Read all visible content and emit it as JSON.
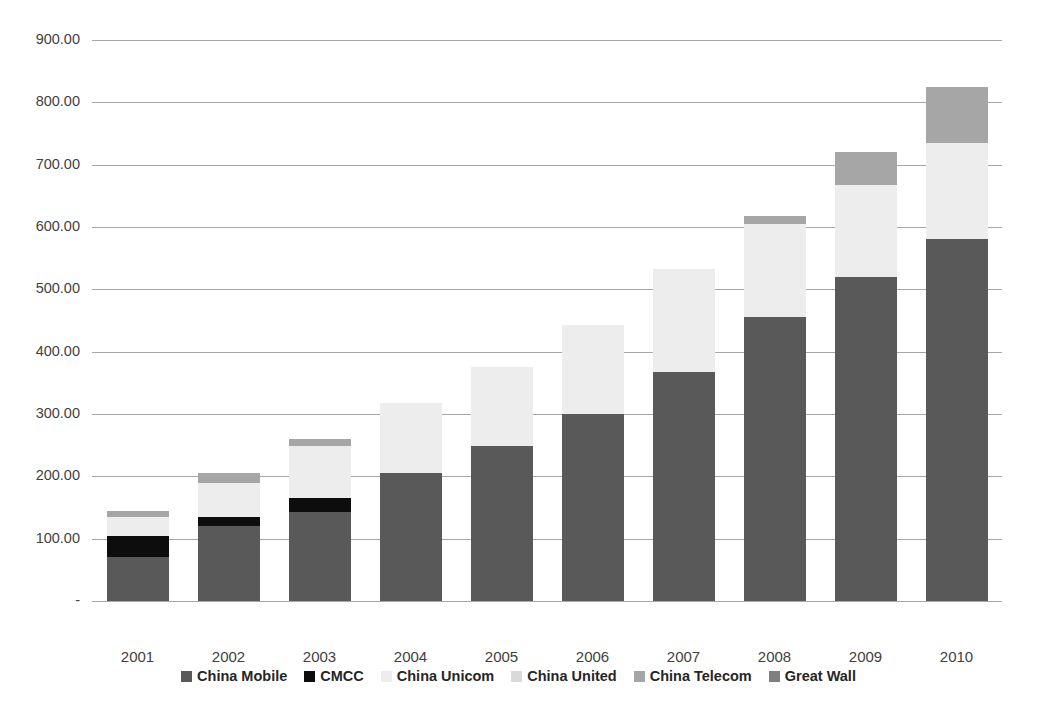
{
  "chart_data": {
    "type": "bar",
    "stacked": true,
    "title": "",
    "xlabel": "",
    "ylabel": "",
    "ylim": [
      0,
      900
    ],
    "grid": true,
    "legend_position": "bottom",
    "categories": [
      "2001",
      "2002",
      "2003",
      "2004",
      "2005",
      "2006",
      "2007",
      "2008",
      "2009",
      "2010"
    ],
    "ytick_labels": [
      "900.00",
      "800.00",
      "700.00",
      "600.00",
      "500.00",
      "400.00",
      "300.00",
      "200.00",
      "100.00",
      "-"
    ],
    "ytick_values": [
      900,
      800,
      700,
      600,
      500,
      400,
      300,
      200,
      100,
      0
    ],
    "series": [
      {
        "name": "China Mobile",
        "color": "#595959",
        "values": [
          70,
          120,
          143,
          205,
          248,
          300,
          367,
          455,
          520,
          580
        ]
      },
      {
        "name": "CMCC",
        "color": "#0d0d0d",
        "values": [
          35,
          15,
          23,
          0,
          0,
          0,
          0,
          0,
          0,
          0
        ]
      },
      {
        "name": "China Unicom",
        "color": "#ededed",
        "values": [
          30,
          55,
          83,
          113,
          128,
          143,
          165,
          150,
          148,
          155
        ]
      },
      {
        "name": "China United",
        "color": "#d9d9d9",
        "values": [
          0,
          0,
          0,
          0,
          0,
          0,
          0,
          0,
          0,
          0
        ]
      },
      {
        "name": "China Telecom",
        "color": "#a6a6a6",
        "values": [
          10,
          15,
          11,
          0,
          0,
          0,
          0,
          12,
          52,
          90
        ]
      },
      {
        "name": "Great Wall",
        "color": "#7f7f7f",
        "values": [
          0,
          0,
          0,
          0,
          0,
          0,
          0,
          0,
          0,
          0
        ]
      }
    ],
    "totals": [
      145,
      205,
      260,
      318,
      376,
      443,
      532,
      617,
      720,
      825
    ]
  },
  "legend": {
    "items": [
      {
        "label": "China Mobile",
        "color": "#595959"
      },
      {
        "label": "CMCC",
        "color": "#0d0d0d"
      },
      {
        "label": "China Unicom",
        "color": "#ededed"
      },
      {
        "label": "China United",
        "color": "#d9d9d9"
      },
      {
        "label": "China Telecom",
        "color": "#a6a6a6"
      },
      {
        "label": "Great Wall",
        "color": "#7f7f7f"
      }
    ]
  }
}
